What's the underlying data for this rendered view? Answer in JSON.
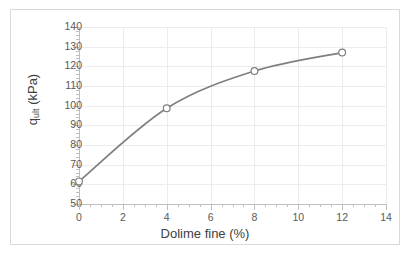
{
  "chart_data": {
    "type": "line",
    "title": "",
    "xlabel": "Dolime fine (%)",
    "ylabel": "q_ult (kPa)",
    "ylabel_base": "q",
    "ylabel_sub": "ult",
    "ylabel_unit": " (kPa)",
    "x": [
      0,
      4,
      8,
      12
    ],
    "values": [
      61.5,
      98.7,
      117.6,
      127.0
    ],
    "series": [
      {
        "name": "q_ult",
        "x": [
          0,
          4,
          8,
          12
        ],
        "values": [
          61.5,
          98.7,
          117.6,
          127.0
        ]
      }
    ],
    "xlim": [
      0,
      14
    ],
    "ylim": [
      50,
      140
    ],
    "x_ticks": [
      "0",
      "2",
      "4",
      "6",
      "8",
      "10",
      "12",
      "14"
    ],
    "x_tick_values": [
      0,
      2,
      4,
      6,
      8,
      10,
      12,
      14
    ],
    "y_ticks": [
      "50",
      "60",
      "70",
      "80",
      "90",
      "100",
      "110",
      "120",
      "130",
      "140"
    ],
    "y_tick_values": [
      50,
      60,
      70,
      80,
      90,
      100,
      110,
      120,
      130,
      140
    ],
    "grid": true,
    "legend": false,
    "legend_position": "none",
    "marker": "open-circle",
    "line_color": "#7f7f7f",
    "marker_fill": "#ffffff",
    "marker_stroke": "#7f7f7f",
    "grid_color": "#ececec",
    "axis_color": "#bfbfbf",
    "text_color": "#595959",
    "title_color": "#404040",
    "border_color": "#d9d9d9",
    "background": "#ffffff"
  }
}
